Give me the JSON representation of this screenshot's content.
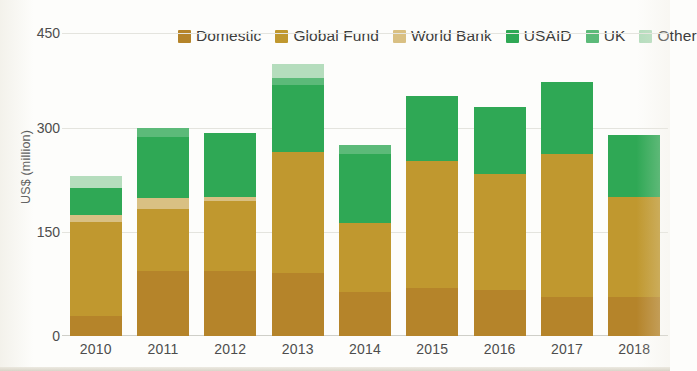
{
  "chart_data": {
    "type": "bar",
    "subtype": "stacked-bar",
    "title": "",
    "xlabel": "",
    "ylabel": "US$ (million)",
    "ylim": [
      0,
      450
    ],
    "yticks": [
      0,
      150,
      300,
      450
    ],
    "grid": true,
    "legend_position": "top-right",
    "categories": [
      "2010",
      "2011",
      "2012",
      "2013",
      "2014",
      "2015",
      "2016",
      "2017",
      "2018"
    ],
    "series": [
      {
        "name": "Domestic",
        "color": "#b5842a",
        "values": [
          30,
          97,
          97,
          94,
          65,
          71,
          69,
          58,
          58
        ]
      },
      {
        "name": "Global Fund",
        "color": "#c0982f",
        "values": [
          140,
          93,
          104,
          180,
          104,
          190,
          172,
          213,
          149
        ]
      },
      {
        "name": "World Bank",
        "color": "#d9c083",
        "values": [
          10,
          16,
          6,
          0,
          0,
          0,
          0,
          0,
          0
        ]
      },
      {
        "name": "USAID",
        "color": "#2fa855",
        "values": [
          40,
          90,
          96,
          100,
          103,
          97,
          100,
          107,
          93
        ]
      },
      {
        "name": "UK",
        "color": "#5cba79",
        "values": [
          0,
          14,
          0,
          10,
          12,
          0,
          0,
          0,
          0
        ]
      },
      {
        "name": "Other",
        "color": "#b5ddbd",
        "values": [
          18,
          0,
          0,
          22,
          0,
          0,
          0,
          0,
          0
        ]
      }
    ],
    "totals": [
      238,
      310,
      303,
      406,
      284,
      358,
      341,
      378,
      300
    ]
  },
  "legend": {
    "items": [
      {
        "label": "Domestic",
        "color": "#b5842a"
      },
      {
        "label": "Global Fund",
        "color": "#c0982f"
      },
      {
        "label": "World Bank",
        "color": "#d9c083"
      },
      {
        "label": "USAID",
        "color": "#2fa855"
      },
      {
        "label": "UK",
        "color": "#5cba79"
      },
      {
        "label": "Other",
        "color": "#b5ddbd"
      }
    ]
  },
  "axes": {
    "y_title": "US$ (million)",
    "y_tick_labels": [
      "450",
      "300",
      "150",
      "0"
    ],
    "x_tick_labels": [
      "2010",
      "2011",
      "2012",
      "2013",
      "2014",
      "2015",
      "2016",
      "2017",
      "2018"
    ]
  },
  "colors": {
    "grid": "#e4e4de",
    "baseline": "#cfcfc8",
    "text": "#4d4d4d",
    "background": "#fdfdfb"
  }
}
